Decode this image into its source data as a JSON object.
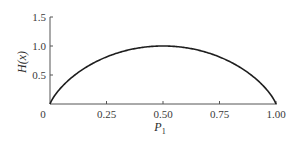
{
  "chart_data": {
    "type": "line",
    "title": "",
    "xlabel": "P1",
    "xlabel_main": "P",
    "xlabel_sub": "1",
    "ylabel": "H(x)",
    "xlim": [
      0,
      1.0
    ],
    "ylim": [
      0,
      1.5
    ],
    "grid": false,
    "legend": null,
    "x_ticks": [
      0,
      0.25,
      0.5,
      0.75,
      1.0
    ],
    "x_tick_labels": [
      "0",
      "0.25",
      "0.50",
      "0.75",
      "1.00"
    ],
    "y_ticks": [
      0.5,
      1.0,
      1.5
    ],
    "y_tick_labels": [
      "0.5",
      "1.0",
      "1.5"
    ],
    "series": [
      {
        "name": "H(x)",
        "function": "binary entropy: -p*log2(p) - (1-p)*log2(1-p)",
        "x": [
          0,
          0.05,
          0.1,
          0.15,
          0.2,
          0.25,
          0.3,
          0.35,
          0.4,
          0.45,
          0.5,
          0.55,
          0.6,
          0.65,
          0.7,
          0.75,
          0.8,
          0.85,
          0.9,
          0.95,
          1.0
        ],
        "y": [
          0,
          0.286,
          0.469,
          0.61,
          0.722,
          0.811,
          0.881,
          0.934,
          0.971,
          0.993,
          1.0,
          0.993,
          0.971,
          0.934,
          0.881,
          0.811,
          0.722,
          0.61,
          0.469,
          0.286,
          0
        ]
      }
    ]
  }
}
